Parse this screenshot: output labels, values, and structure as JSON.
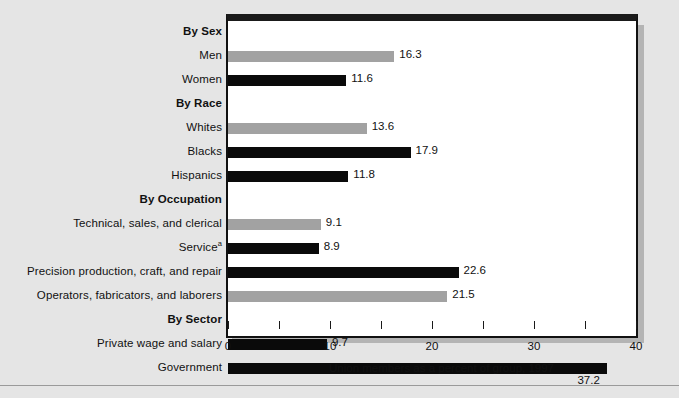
{
  "chart_data": {
    "type": "bar",
    "orientation": "horizontal",
    "title": "",
    "xlabel": "Union members as a percent of group, 1997",
    "ylabel": "",
    "xlim": [
      0,
      40
    ],
    "xticks": [
      0,
      5,
      10,
      15,
      20,
      25,
      30,
      35,
      40
    ],
    "xtick_labels": [
      {
        "value": 0,
        "label": "0"
      },
      {
        "value": 10,
        "label": "10"
      },
      {
        "value": 20,
        "label": "20"
      },
      {
        "value": 30,
        "label": "30"
      },
      {
        "value": 40,
        "label": "40"
      }
    ],
    "grid": false,
    "legend": "none",
    "colors": {
      "gray_bar": "#a2a2a2",
      "black_bar": "#0a0a0a",
      "background": "#e5e5e5",
      "plot_background": "#ffffff",
      "frame": "#111111"
    },
    "footnote_marker": "a",
    "rows": [
      {
        "kind": "heading",
        "label": "By Sex",
        "value": null,
        "color": null,
        "value_text": "",
        "value_below": false
      },
      {
        "kind": "bar",
        "label": "Men",
        "value": 16.3,
        "color": "gray",
        "value_text": "16.3",
        "value_below": false
      },
      {
        "kind": "bar",
        "label": "Women",
        "value": 11.6,
        "color": "black",
        "value_text": "11.6",
        "value_below": false
      },
      {
        "kind": "heading",
        "label": "By Race",
        "value": null,
        "color": null,
        "value_text": "",
        "value_below": false
      },
      {
        "kind": "bar",
        "label": "Whites",
        "value": 13.6,
        "color": "gray",
        "value_text": "13.6",
        "value_below": false
      },
      {
        "kind": "bar",
        "label": "Blacks",
        "value": 17.9,
        "color": "black",
        "value_text": "17.9",
        "value_below": false
      },
      {
        "kind": "bar",
        "label": "Hispanics",
        "value": 11.8,
        "color": "black",
        "value_text": "11.8",
        "value_below": false
      },
      {
        "kind": "heading",
        "label": "By Occupation",
        "value": null,
        "color": null,
        "value_text": "",
        "value_below": false
      },
      {
        "kind": "bar",
        "label": "Technical, sales, and clerical",
        "value": 9.1,
        "color": "gray",
        "value_text": "9.1",
        "value_below": false
      },
      {
        "kind": "bar",
        "label": "Service",
        "sup": "a",
        "value": 8.9,
        "color": "black",
        "value_text": "8.9",
        "value_below": false
      },
      {
        "kind": "bar",
        "label": "Precision production, craft, and repair",
        "value": 22.6,
        "color": "black",
        "value_text": "22.6",
        "value_below": false
      },
      {
        "kind": "bar",
        "label": "Operators, fabricators, and laborers",
        "value": 21.5,
        "color": "gray",
        "value_text": "21.5",
        "value_below": false
      },
      {
        "kind": "heading",
        "label": "By Sector",
        "value": null,
        "color": null,
        "value_text": "",
        "value_below": false
      },
      {
        "kind": "bar",
        "label": "Private wage and salary",
        "value": 9.7,
        "color": "black",
        "value_text": "9.7",
        "value_below": false
      },
      {
        "kind": "bar",
        "label": "Government",
        "value": 37.2,
        "color": "black",
        "value_text": "37.2",
        "value_below": true
      }
    ]
  }
}
